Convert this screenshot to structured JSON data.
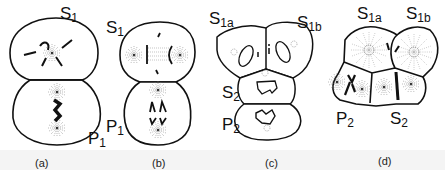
{
  "figure": {
    "panels": [
      {
        "id": "a",
        "caption": "(a)",
        "labels": [
          {
            "main": "S",
            "sub": "1"
          },
          {
            "main": "P",
            "sub": "1"
          }
        ]
      },
      {
        "id": "b",
        "caption": "(b)",
        "labels": [
          {
            "main": "S",
            "sub": "1"
          },
          {
            "main": "P",
            "sub": "1"
          }
        ]
      },
      {
        "id": "c",
        "caption": "(c)",
        "labels": [
          {
            "main": "S",
            "sub": "1a"
          },
          {
            "main": "S",
            "sub": "1b"
          },
          {
            "main": "S",
            "sub": "2"
          },
          {
            "main": "P",
            "sub": "2"
          }
        ]
      },
      {
        "id": "d",
        "caption": "(d)",
        "labels": [
          {
            "main": "S",
            "sub": "1a"
          },
          {
            "main": "S",
            "sub": "1b"
          },
          {
            "main": "P",
            "sub": "2"
          },
          {
            "main": "S",
            "sub": "2"
          }
        ]
      }
    ]
  }
}
